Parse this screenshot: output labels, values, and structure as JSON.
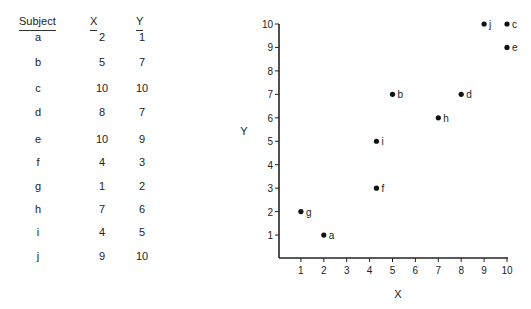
{
  "table": {
    "headers": [
      "Subject",
      "X",
      "Y"
    ],
    "rows": [
      {
        "subject": "a",
        "x": "2",
        "y": "1"
      },
      {
        "subject": "b",
        "x": "5",
        "y": "7"
      },
      {
        "subject": "c",
        "x": "10",
        "y": "10"
      },
      {
        "subject": "d",
        "x": "8",
        "y": "7"
      },
      {
        "subject": "e",
        "x": "10",
        "y": "9"
      },
      {
        "subject": "f",
        "x": "4",
        "y": "3"
      },
      {
        "subject": "g",
        "x": "1",
        "y": "2"
      },
      {
        "subject": "h",
        "x": "7",
        "y": "6"
      },
      {
        "subject": "i",
        "x": "4",
        "y": "5"
      },
      {
        "subject": "j",
        "x": "9",
        "y": "10"
      }
    ]
  },
  "chart_data": {
    "type": "scatter",
    "title": "",
    "xlabel": "X",
    "ylabel": "Y",
    "xlim": [
      0,
      10
    ],
    "ylim": [
      0,
      10
    ],
    "x_ticks": [
      "1",
      "2",
      "3",
      "4",
      "5",
      "6",
      "7",
      "8",
      "9",
      "10"
    ],
    "y_ticks": [
      "1",
      "2",
      "3",
      "4",
      "5",
      "6",
      "7",
      "8",
      "9",
      "10"
    ],
    "grid": false,
    "legend": null,
    "points": [
      {
        "label": "a",
        "x": 2,
        "y": 1
      },
      {
        "label": "b",
        "x": 5,
        "y": 7
      },
      {
        "label": "c",
        "x": 10,
        "y": 10
      },
      {
        "label": "d",
        "x": 8,
        "y": 7
      },
      {
        "label": "e",
        "x": 10,
        "y": 9
      },
      {
        "label": "f",
        "x": 4,
        "y": 3
      },
      {
        "label": "g",
        "x": 1,
        "y": 2
      },
      {
        "label": "h",
        "x": 7,
        "y": 6
      },
      {
        "label": "i",
        "x": 4,
        "y": 5
      },
      {
        "label": "j",
        "x": 9,
        "y": 10
      }
    ]
  }
}
